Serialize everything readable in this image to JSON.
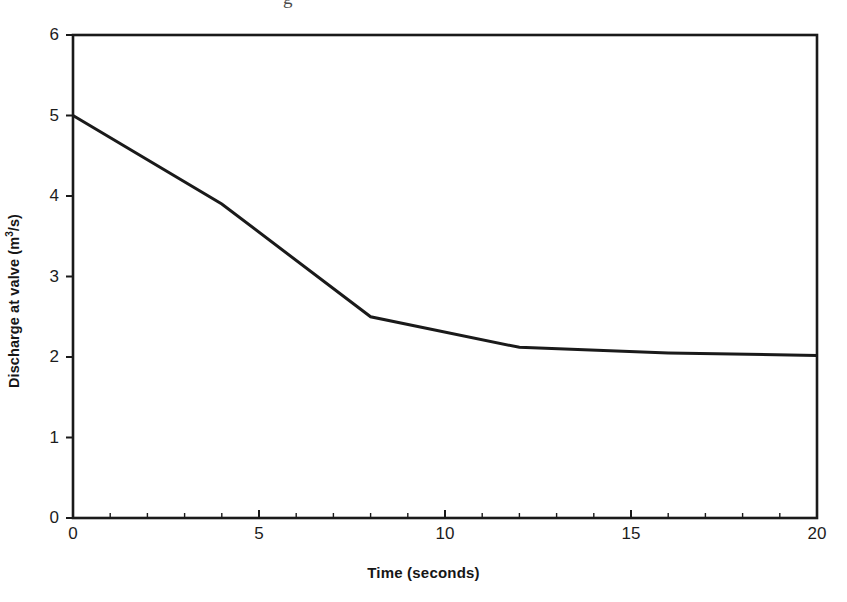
{
  "figure": {
    "cut_caption_fragment": "g",
    "plot_area": {
      "left": 73,
      "top": 35,
      "right": 817,
      "bottom": 518
    }
  },
  "chart_data": {
    "type": "line",
    "title": "",
    "xlabel": "Time (seconds)",
    "ylabel_parts": {
      "before": "Discharge at valve (m",
      "sup": "3",
      "after": "/s)"
    },
    "ylabel": "Discharge at valve (m3/s)",
    "xlim": [
      0,
      20
    ],
    "ylim": [
      0,
      6
    ],
    "xticks": [
      0,
      5,
      10,
      15,
      20
    ],
    "xtick_labels": [
      "0",
      "5",
      "10",
      "15",
      "20"
    ],
    "x_minor_tick_step": 1,
    "yticks": [
      0,
      1,
      2,
      3,
      4,
      5,
      6
    ],
    "ytick_labels": [
      "0",
      "1",
      "2",
      "3",
      "4",
      "5",
      "6"
    ],
    "grid": false,
    "legend": "none",
    "line_color": "#1a1a1a",
    "line_width": 3,
    "series": [
      {
        "name": "Discharge at valve",
        "x": [
          0,
          4,
          8,
          12,
          16,
          20
        ],
        "values": [
          5.0,
          3.9,
          2.5,
          2.12,
          2.05,
          2.02
        ]
      }
    ]
  }
}
